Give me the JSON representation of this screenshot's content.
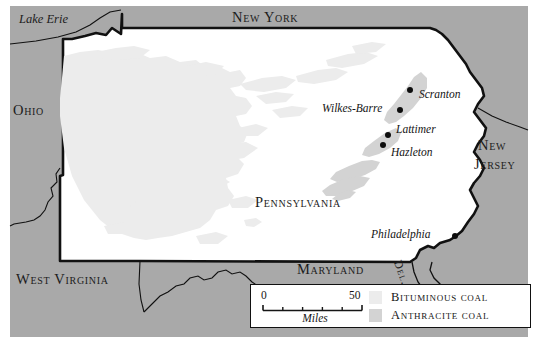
{
  "map": {
    "title": "Pennsylvania coal regions map",
    "colors": {
      "background_land": "#a9a9a9",
      "pennsylvania_fill": "#ffffff",
      "bituminous_coal": "#ececec",
      "anthracite_coal": "#d3d3d3",
      "border_stroke": "#111111",
      "label_text": "#1a1a1a",
      "legend_background": "#ffffff",
      "city_dot": "#0d0d0d"
    },
    "state_labels": [
      {
        "name": "new-york",
        "text": "New York",
        "x": 232,
        "y": 10
      },
      {
        "name": "ohio",
        "text": "Ohio",
        "x": 13,
        "y": 103
      },
      {
        "name": "new-jersey-line1",
        "text": "New",
        "x": 478,
        "y": 139
      },
      {
        "name": "new-jersey-line2",
        "text": "Jersey",
        "x": 474,
        "y": 158
      },
      {
        "name": "pennsylvania",
        "text": "Pennsylvania",
        "x": 255,
        "y": 195
      },
      {
        "name": "maryland",
        "text": "Maryland",
        "x": 297,
        "y": 262
      },
      {
        "name": "west-virginia",
        "text": "West Virginia",
        "x": 16,
        "y": 272
      }
    ],
    "water_labels": [
      {
        "name": "lake-erie",
        "text": "Lake Erie",
        "x": 19,
        "y": 13
      }
    ],
    "delaware_label": "Del.",
    "cities": [
      {
        "name": "scranton",
        "text": "Scranton",
        "dot_x": 410,
        "dot_y": 90,
        "label_x": 419,
        "label_y": 88
      },
      {
        "name": "wilkes-barre",
        "text": "Wilkes-Barre",
        "dot_x": 400,
        "dot_y": 110,
        "label_x": 322,
        "label_y": 102
      },
      {
        "name": "lattimer",
        "text": "Lattimer",
        "dot_x": 388,
        "dot_y": 135,
        "label_x": 396,
        "label_y": 123
      },
      {
        "name": "hazleton",
        "text": "Hazleton",
        "dot_x": 383,
        "dot_y": 145,
        "label_x": 391,
        "label_y": 146
      },
      {
        "name": "philadelphia",
        "text": "Philadelphia",
        "dot_x": 455,
        "dot_y": 236,
        "label_x": 371,
        "label_y": 228
      }
    ],
    "legend": {
      "scale": {
        "min_label": "0",
        "max_label": "50",
        "unit_label": "Miles",
        "ticks": 6
      },
      "entries": [
        {
          "name": "bituminous-coal",
          "label": "Bituminous coal",
          "color": "#ececec"
        },
        {
          "name": "anthracite-coal",
          "label": "Anthracite coal",
          "color": "#d3d3d3"
        }
      ]
    }
  }
}
